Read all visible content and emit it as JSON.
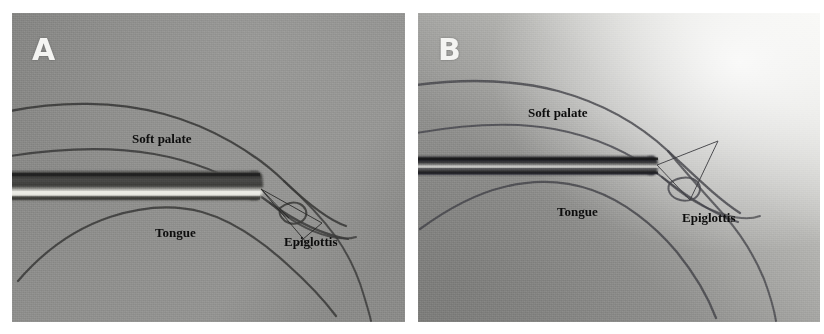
{
  "figure": {
    "background_color": "#ffffff",
    "width": 824,
    "height": 334,
    "panel_count": 2
  },
  "panels": [
    {
      "id": "A",
      "letter": "A",
      "letter_color": "#f4f4f2",
      "background_color": "#8d8d8b",
      "tube_style": "thick-metallic-highlight",
      "annotations": [
        {
          "name": "soft-palate",
          "label": "Soft palate"
        },
        {
          "name": "tongue",
          "label": "Tongue"
        },
        {
          "name": "epiglottis",
          "label": "Epiglottis"
        }
      ]
    },
    {
      "id": "B",
      "letter": "B",
      "letter_color": "#f6f6f4",
      "background_color": "#9a9a98",
      "tube_style": "thin-dark",
      "annotations": [
        {
          "name": "soft-palate",
          "label": "Soft palate"
        },
        {
          "name": "tongue",
          "label": "Tongue"
        },
        {
          "name": "epiglottis",
          "label": "Epiglottis"
        }
      ]
    }
  ],
  "labels": {
    "soft_palate": "Soft palate",
    "tongue": "Tongue",
    "epiglottis": "Epiglottis",
    "panel_a_letter": "A",
    "panel_b_letter": "B"
  },
  "colors": {
    "annotation_text": "#0d0d0d",
    "panel_letter": "#f4f4f2",
    "pencil_line": "#3d3d3b",
    "pointer_line": "#2e2e2c",
    "page_background": "#ffffff"
  }
}
